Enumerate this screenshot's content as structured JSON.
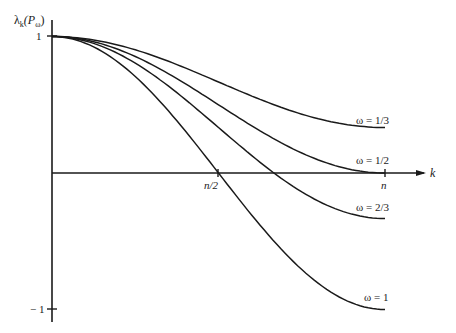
{
  "chart_data": {
    "type": "line",
    "title": "",
    "ylabel": "λ_k(P_ω)",
    "xlabel": "k",
    "x_ticks": [
      {
        "value": 0.5,
        "label": "n/2"
      },
      {
        "value": 1.0,
        "label": "n"
      }
    ],
    "y_ticks": [
      {
        "value": 1,
        "label": "1"
      },
      {
        "value": -1,
        "label": "−1"
      }
    ],
    "xlim": [
      0,
      1
    ],
    "ylim": [
      -1,
      1
    ],
    "grid": false,
    "formula": "λ_k = 1 − ω + ω·cos(πk/n)",
    "series": [
      {
        "name": "ω = 1/3",
        "omega": 0.3333,
        "x": [
          0,
          0.25,
          0.5,
          0.75,
          1.0
        ],
        "values": [
          1.0,
          0.902,
          0.667,
          0.431,
          0.333
        ]
      },
      {
        "name": "ω = 1/2",
        "omega": 0.5,
        "x": [
          0,
          0.25,
          0.5,
          0.75,
          1.0
        ],
        "values": [
          1.0,
          0.854,
          0.5,
          0.146,
          0.0
        ]
      },
      {
        "name": "ω = 2/3",
        "omega": 0.6667,
        "x": [
          0,
          0.25,
          0.5,
          0.75,
          1.0
        ],
        "values": [
          1.0,
          0.805,
          0.333,
          -0.138,
          -0.333
        ]
      },
      {
        "name": "ω = 1",
        "omega": 1.0,
        "x": [
          0,
          0.25,
          0.5,
          0.75,
          1.0
        ],
        "values": [
          1.0,
          0.707,
          0.0,
          -0.707,
          -1.0
        ]
      }
    ]
  },
  "labels": {
    "ylabel_main": "λ",
    "ylabel_sub": "k",
    "ylabel_rest": "(P",
    "ylabel_sub2": "ω",
    "ylabel_close": ")",
    "xlabel": "k",
    "y_one": "1",
    "y_minus_one": "− 1",
    "x_half": "n/2",
    "x_n": "n",
    "curve_1_3": "ω = 1/3",
    "curve_1_2": "ω = 1/2",
    "curve_2_3": "ω = 2/3",
    "curve_1": "ω = 1"
  }
}
